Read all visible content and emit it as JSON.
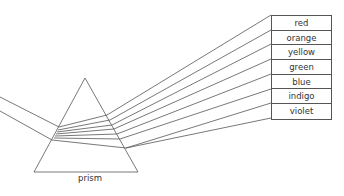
{
  "diagram": {
    "prism_label": "prism",
    "spectrum": [
      {
        "name": "red"
      },
      {
        "name": "orange"
      },
      {
        "name": "yellow"
      },
      {
        "name": "green"
      },
      {
        "name": "blue"
      },
      {
        "name": "indigo"
      },
      {
        "name": "violet"
      }
    ],
    "line_color": "#555555"
  }
}
